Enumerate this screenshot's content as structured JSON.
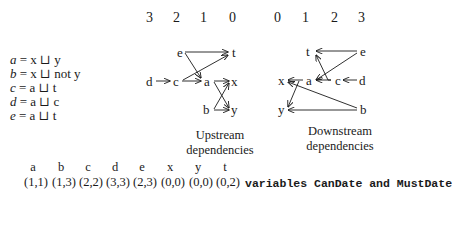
{
  "equations": [
    {
      "lhs": "a",
      "rhs": "= x ⊔ y"
    },
    {
      "lhs": "b",
      "rhs": "= x ⊔ not y"
    },
    {
      "lhs": "c",
      "rhs": "= a ⊔ t"
    },
    {
      "lhs": "d",
      "rhs": "= a ⊔ c"
    },
    {
      "lhs": "e",
      "rhs": "= a ⊔ t"
    }
  ],
  "upstream": {
    "columns": [
      "3",
      "2",
      "1",
      "0"
    ],
    "caption_line1": "Upstream",
    "caption_line2": "dependencies",
    "nodes": {
      "e": "e",
      "t": "t",
      "d": "d",
      "c": "c",
      "a": "a",
      "x": "x",
      "b": "b",
      "y": "y"
    },
    "edges": [
      [
        "e",
        "t"
      ],
      [
        "e",
        "a"
      ],
      [
        "c",
        "t"
      ],
      [
        "d",
        "c"
      ],
      [
        "c",
        "a"
      ],
      [
        "a",
        "x"
      ],
      [
        "a",
        "y"
      ],
      [
        "b",
        "x"
      ],
      [
        "b",
        "y"
      ]
    ]
  },
  "downstream": {
    "columns": [
      "0",
      "1",
      "2",
      "3"
    ],
    "caption_line1": "Downstream",
    "caption_line2": "dependencies",
    "nodes": {
      "t": "t",
      "e": "e",
      "x": "x",
      "a": "a",
      "c": "c",
      "d": "d",
      "y": "y",
      "b": "b"
    },
    "edges": [
      [
        "e",
        "t"
      ],
      [
        "e",
        "a"
      ],
      [
        "c",
        "t"
      ],
      [
        "d",
        "c"
      ],
      [
        "c",
        "a"
      ],
      [
        "a",
        "x"
      ],
      [
        "x",
        "y"
      ],
      [
        "b",
        "x"
      ],
      [
        "b",
        "y"
      ]
    ]
  },
  "table": {
    "variables": [
      "a",
      "b",
      "c",
      "d",
      "e",
      "x",
      "y",
      "t"
    ],
    "values": [
      "(1,1)",
      "(1,3)",
      "(2,2)",
      "(3,3)",
      "(2,3)",
      "(0,0)",
      "(0,0)",
      "(0,2)"
    ],
    "label": "variables CanDate and MustDate"
  }
}
